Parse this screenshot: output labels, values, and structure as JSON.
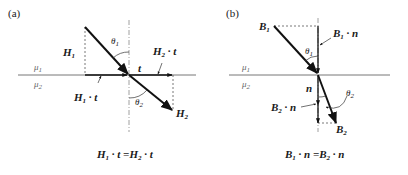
{
  "panels": [
    {
      "id": "a",
      "label": "(a)",
      "media": {
        "upper": "μ",
        "upper_sub": "1",
        "lower": "μ",
        "lower_sub": "2"
      },
      "vectors": {
        "H1": {
          "base": "H",
          "sub": "1"
        },
        "H2": {
          "base": "H",
          "sub": "2"
        },
        "t": "t",
        "H1t": {
          "base": "H",
          "sub": "1",
          "tail": " · t"
        },
        "H2t": {
          "base": "H",
          "sub": "2",
          "tail": " · t"
        }
      },
      "angles": {
        "theta1": {
          "base": "θ",
          "sub": "1"
        },
        "theta2": {
          "base": "θ",
          "sub": "2"
        }
      },
      "equation": {
        "left_base": "H",
        "left_sub": "1",
        "left_tail": " · t =",
        "right_base": "H",
        "right_sub": "2",
        "right_tail": " · t"
      }
    },
    {
      "id": "b",
      "label": "(b)",
      "media": {
        "upper": "μ",
        "upper_sub": "1",
        "lower": "μ",
        "lower_sub": "2"
      },
      "vectors": {
        "B1": {
          "base": "B",
          "sub": "1"
        },
        "B2": {
          "base": "B",
          "sub": "2"
        },
        "n": "n",
        "B1n": {
          "base": "B",
          "sub": "1",
          "tail": " · n"
        },
        "B2n": {
          "base": "B",
          "sub": "2",
          "tail": " · n"
        }
      },
      "angles": {
        "theta1": {
          "base": "θ",
          "sub": "1"
        },
        "theta2": {
          "base": "θ",
          "sub": "2"
        }
      },
      "equation": {
        "left_base": "B",
        "left_sub": "1",
        "left_tail": " · n =",
        "right_base": "B",
        "right_sub": "2",
        "right_tail": " · n"
      }
    }
  ]
}
